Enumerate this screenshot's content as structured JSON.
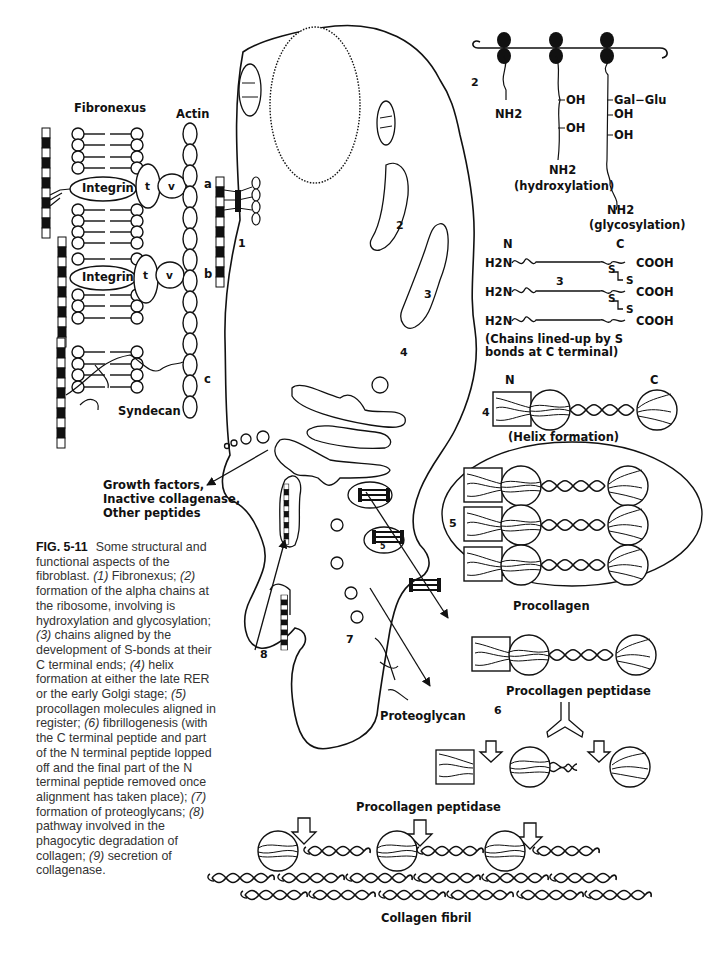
{
  "figure": {
    "id": "FIG. 5-11",
    "caption_intro": "Some structural and functional aspects of the fibroblast.",
    "caption_items": [
      {
        "num": "(1)",
        "text": "Fibronexus;"
      },
      {
        "num": "(2)",
        "text": "formation of the alpha chains at the ribosome, involving is hydroxylation and glycosylation;"
      },
      {
        "num": "(3)",
        "text": "chains aligned by the development of S-bonds at their C terminal ends;"
      },
      {
        "num": "(4)",
        "text": "helix formation at either the late RER or the early Golgi stage;"
      },
      {
        "num": "(5)",
        "text": "procollagen molecules aligned in register;"
      },
      {
        "num": "(6)",
        "text": "fibrillogenesis (with the C terminal peptide and part of the N terminal peptide lopped off and the final part of the N terminal peptide removed once alignment has taken place);"
      },
      {
        "num": "(7)",
        "text": "formation of proteoglycans;"
      },
      {
        "num": "(8)",
        "text": "pathway involved in the phagocytic degradation of collagen;"
      },
      {
        "num": "(9)",
        "text": "secretion of collagenase."
      }
    ]
  },
  "fibronexus": {
    "title": "Fibronexus",
    "actin_label": "Actin",
    "integrin_label": "Integrin",
    "talin_label": "t",
    "vinculin_label": "v",
    "site_labels": [
      "a",
      "b",
      "c"
    ],
    "syndecan_label": "Syndecan"
  },
  "cell": {
    "markers": [
      "1",
      "2",
      "3",
      "4",
      "5",
      "7",
      "8"
    ],
    "secretion_label_lines": [
      "Growth factors,",
      "Inactive collagenase,",
      "Other peptides"
    ],
    "proteoglycan_label": "Proteoglycan"
  },
  "chain_formation": {
    "step": "2",
    "chain1_label": "NH2",
    "chain2_groups": [
      "OH",
      "OH"
    ],
    "chain2_label": "NH2",
    "chain2_caption": "(hydroxylation)",
    "chain3_groups": [
      "Gal−Glu",
      "OH",
      "OH"
    ],
    "chain3_label": "NH2",
    "chain3_caption": "(glycosylation)"
  },
  "alignment": {
    "step": "3",
    "n_label": "N",
    "c_label": "C",
    "chain_start": "H2N",
    "chain_end": "COOH",
    "bond_label": "S",
    "caption": "(Chains lined-up by S bonds at C terminal)"
  },
  "helix": {
    "step": "4",
    "n_label": "N",
    "c_label": "C",
    "caption": "(Helix formation)"
  },
  "procollagen": {
    "step": "5",
    "label": "Procollagen"
  },
  "fibrillogenesis": {
    "step": "6",
    "enzyme_label_1": "Procollagen peptidase",
    "enzyme_label_2": "Procollagen peptidase",
    "fibril_label": "Collagen fibril"
  },
  "colors": {
    "ink": "#111111",
    "caption_text": "#333333",
    "background": "#ffffff"
  }
}
